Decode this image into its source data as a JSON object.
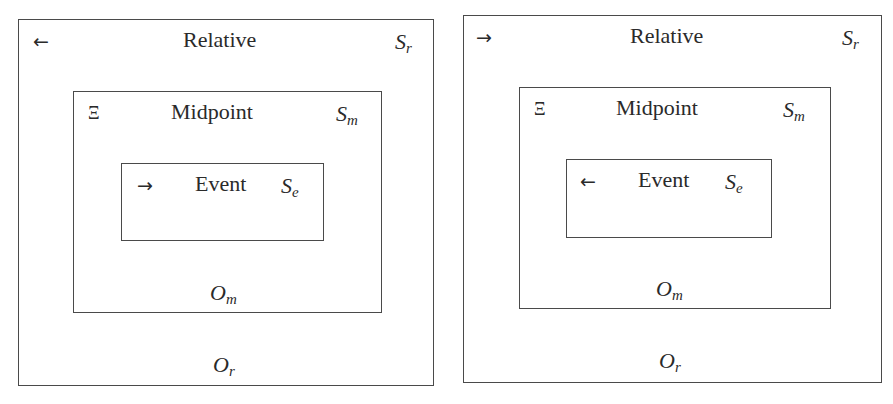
{
  "diagrams": [
    {
      "relative": {
        "title": "Relative",
        "arrow": "←",
        "arrow_icon": "arrow-left-icon",
        "S_base": "S",
        "S_sub": "r",
        "O_base": "O",
        "O_sub": "r"
      },
      "midpoint": {
        "title": "Midpoint",
        "symbol": "Ξ",
        "S_base": "S",
        "S_sub": "m",
        "O_base": "O",
        "O_sub": "m"
      },
      "event": {
        "title": "Event",
        "arrow": "→",
        "arrow_icon": "arrow-right-icon",
        "S_base": "S",
        "S_sub": "e"
      }
    },
    {
      "relative": {
        "title": "Relative",
        "arrow": "→",
        "arrow_icon": "arrow-right-icon",
        "S_base": "S",
        "S_sub": "r",
        "O_base": "O",
        "O_sub": "r"
      },
      "midpoint": {
        "title": "Midpoint",
        "symbol": "Ξ",
        "S_base": "S",
        "S_sub": "m",
        "O_base": "O",
        "O_sub": "m"
      },
      "event": {
        "title": "Event",
        "arrow": "←",
        "arrow_icon": "arrow-left-icon",
        "S_base": "S",
        "S_sub": "e"
      }
    }
  ]
}
